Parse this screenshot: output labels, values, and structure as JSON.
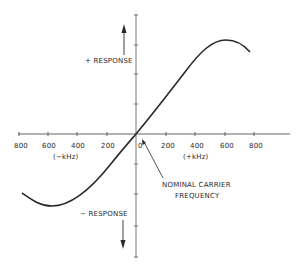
{
  "diagram": {
    "type": "frequency-discriminator-response-curve",
    "x_axis": {
      "negative_ticks": [
        "800",
        "600",
        "400",
        "200"
      ],
      "zero_label": "0",
      "positive_ticks": [
        "200",
        "400",
        "600",
        "800"
      ],
      "negative_unit": "(−kHz)",
      "positive_unit": "(+kHz)"
    },
    "y_axis": {
      "positive_label": "+ RESPONSE",
      "negative_label": "− RESPONSE"
    },
    "annotation": {
      "line1": "NOMINAL CARRIER",
      "line2": "FREQUENCY"
    },
    "colors": {
      "ink": "#2a2a2a",
      "axis": "#555555",
      "background": "#ffffff"
    }
  }
}
